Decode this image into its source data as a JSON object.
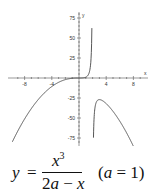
{
  "chart_data": {
    "type": "line",
    "title": "",
    "formula": "y = x^3 / (2a - x)   (a = 1)",
    "xlabel": "x",
    "ylabel": "y",
    "xlim": [
      -10,
      10
    ],
    "ylim": [
      -85,
      85
    ],
    "x_ticks": [
      -8,
      -4,
      4,
      8
    ],
    "y_ticks": [
      75,
      50,
      25,
      -25,
      -50,
      -75
    ],
    "grid": false,
    "vertical_asymptote": 2,
    "series": [
      {
        "name": "left branch (x < 2)",
        "x": [
          -9.8,
          -9,
          -8,
          -7,
          -6,
          -5,
          -4,
          -3,
          -2,
          -1,
          0,
          1,
          1.5,
          1.7,
          1.8,
          1.85,
          1.9
        ],
        "values": [
          -80.2,
          -66.3,
          -51.2,
          -38.1,
          -27.0,
          -17.9,
          -10.7,
          -5.4,
          -2.0,
          -0.33,
          0,
          1,
          6.75,
          16.4,
          29.2,
          42.2,
          68.6
        ]
      },
      {
        "name": "right branch (x > 2)",
        "x": [
          2.1,
          2.2,
          2.5,
          3,
          4,
          5,
          6,
          7,
          8
        ],
        "values": [
          -92.6,
          -53.2,
          -31.3,
          -27,
          -32,
          -41.7,
          -54,
          -68.6,
          -85.3
        ]
      }
    ]
  },
  "axes": {
    "x_name": "x",
    "y_name": "y",
    "x_tick_labels": [
      "-8",
      "-4",
      "4",
      "8"
    ],
    "y_tick_labels": [
      "75",
      "50",
      "25",
      "-25",
      "-50",
      "-75"
    ]
  },
  "caption": {
    "lhs": "y",
    "eq": "=",
    "num_var": "x",
    "num_exp": "3",
    "den_coef": "2",
    "den_a": "a",
    "den_minus": " − ",
    "den_x": "x",
    "param_open": "(",
    "param_a": "a",
    "param_rest": " = 1)"
  }
}
